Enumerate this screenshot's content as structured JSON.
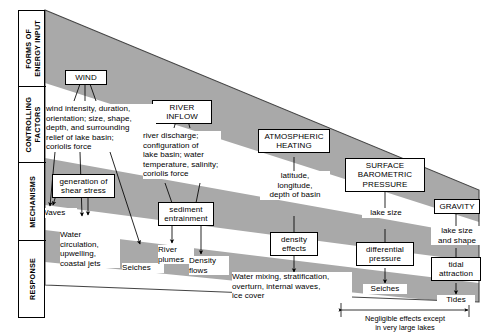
{
  "diagram": {
    "colors": {
      "band": "#a8a8a8",
      "outline": "#3a3a3a",
      "text": "#000000",
      "background": "#ffffff"
    },
    "categories": [
      {
        "id": "forms-of-energy-input",
        "label": "FORMS OF\nENERGY INPUT"
      },
      {
        "id": "controlling-factors",
        "label": "CONTROLLING\nFACTORS"
      },
      {
        "id": "mechanisms",
        "label": "MECHANISMS"
      },
      {
        "id": "response",
        "label": "RESPONSE"
      }
    ],
    "energy_inputs": [
      {
        "id": "wind",
        "label": "WIND"
      },
      {
        "id": "river-inflow",
        "label": "RIVER INFLOW"
      },
      {
        "id": "atmospheric-heating",
        "label": "ATMOSPHERIC\nHEATING"
      },
      {
        "id": "surface-barometric-pressure",
        "label": "SURFACE\nBAROMETRIC\nPRESSURE"
      },
      {
        "id": "gravity",
        "label": "GRAVITY"
      }
    ],
    "controlling_factors": [
      {
        "id": "wind-factors",
        "text": "wind intensity, duration,\norientation; size, shape,\ndepth, and surrounding\nrelief of lake basin;\ncoriolis force"
      },
      {
        "id": "river-factors",
        "text": "river discharge;\nconfiguration of\nlake basin; water\ntemperature, salinity;\ncoriolis force"
      },
      {
        "id": "heating-factors",
        "text": "latitude,\nlongitude,\ndepth of basin"
      },
      {
        "id": "pressure-factors",
        "text": "lake size"
      },
      {
        "id": "gravity-factors",
        "text": "lake size\nand shape"
      }
    ],
    "mechanisms": [
      {
        "id": "shear-stress",
        "label": "generation of\nshear stress"
      },
      {
        "id": "sediment-entrainment",
        "label": "sediment\nentrainment"
      },
      {
        "id": "density-effects",
        "label": "density\neffects"
      },
      {
        "id": "differential-pressure",
        "label": "differential\npressure"
      },
      {
        "id": "tidal-attraction",
        "label": "tidal\nattraction"
      }
    ],
    "responses": [
      {
        "id": "waves",
        "text": "Waves"
      },
      {
        "id": "water-circulation",
        "text": "Water\ncirculation,\nupwelling,\ncoastal jets"
      },
      {
        "id": "seiches-wind",
        "text": "Seiches"
      },
      {
        "id": "river-plumes",
        "text": "River\nplumes"
      },
      {
        "id": "density-flows",
        "text": "Density\nflows"
      },
      {
        "id": "water-mixing",
        "text": "Water mixing, stratification,\noverturn, internal waves,\nice cover"
      },
      {
        "id": "seiches-pressure",
        "text": "Seiches"
      },
      {
        "id": "tides",
        "text": "Tides"
      }
    ],
    "annotation": {
      "id": "negligible-effects-note",
      "text": "Negligible effects except\nin very large lakes"
    }
  }
}
